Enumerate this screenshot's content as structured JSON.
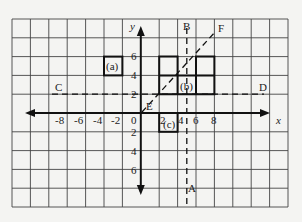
{
  "diagram": {
    "type": "coordinate-grid-transformations",
    "grid": {
      "columns": 15,
      "rows": 10,
      "unit_per_cell": 2,
      "x_range": [
        -12,
        18
      ],
      "y_range": [
        -10,
        10
      ]
    },
    "axes": {
      "x_label": "x",
      "y_label": "y",
      "origin_label": "0",
      "x_ticks_negative": [
        "-8",
        "-6",
        "-4",
        "-2"
      ],
      "x_ticks_positive": [
        "2",
        "4",
        "6",
        "8"
      ],
      "y_ticks_positive": [
        "2",
        "4",
        "6"
      ],
      "y_ticks_negative": [
        "2",
        "4",
        "6"
      ]
    },
    "shapes": [
      {
        "label": "(a)",
        "description": "single square from (-4,4) to (-2,6)"
      },
      {
        "label": "(b)",
        "description": "L/T-shaped figure of squares with cells (2,2)-(4,4), (4,2)-(6,4), (2,4)-(4,6), (6,4)-(8,6), (6,2)-(8,4)"
      },
      {
        "label": "(c)",
        "description": "single square from (2,-2) to (4,0)"
      }
    ],
    "lines": [
      {
        "label": "A",
        "description": "dashed vertical line x=5, lower end label"
      },
      {
        "label": "B",
        "description": "dashed vertical line x=5, upper end label"
      },
      {
        "label": "C",
        "description": "dashed horizontal line y=2, left end label"
      },
      {
        "label": "D",
        "description": "dashed horizontal line y=2, right end label"
      },
      {
        "label": "E",
        "description": "dashed diagonal line y=x, lower end label"
      },
      {
        "label": "F",
        "description": "dashed diagonal line y=x, upper end label"
      }
    ],
    "colors": {
      "background": "#f4f4f2",
      "grid": "#333333",
      "ink": "#111111"
    }
  }
}
